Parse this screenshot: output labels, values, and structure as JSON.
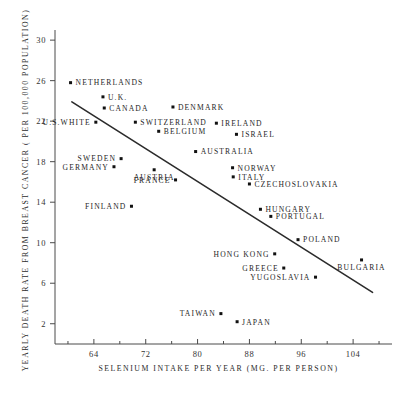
{
  "chart_data": {
    "type": "scatter",
    "title": "",
    "xlabel": "SELENIUM INTAKE PER YEAR (MG. PER PERSON)",
    "ylabel": "YEARLY DEATH RATE FROM BREAST CANCER ( PER 100,000 POPULATION)",
    "xlim": [
      58,
      110
    ],
    "ylim": [
      0,
      31
    ],
    "xticks": [
      64,
      72,
      80,
      88,
      96,
      104
    ],
    "yticks": [
      2,
      6,
      10,
      14,
      18,
      22,
      26,
      30
    ],
    "xtick_labels": [
      "64",
      "72",
      "80",
      "88",
      "96",
      "104"
    ],
    "ytick_labels": [
      "2",
      "6",
      "10",
      "14",
      "18",
      "22",
      "26",
      "30"
    ],
    "grid": false,
    "legend": "none",
    "points": [
      {
        "label": "NETHERLANDS",
        "x": 60.4,
        "y": 25.8,
        "label_side": "right"
      },
      {
        "label": "U.K.",
        "x": 65.4,
        "y": 24.4,
        "label_side": "right"
      },
      {
        "label": "CANADA",
        "x": 65.6,
        "y": 23.3,
        "label_side": "right"
      },
      {
        "label": "DENMARK",
        "x": 76.2,
        "y": 23.4,
        "label_side": "right"
      },
      {
        "label": "SWITZERLAND",
        "x": 70.4,
        "y": 21.9,
        "label_side": "right"
      },
      {
        "label": "IRELAND",
        "x": 82.9,
        "y": 21.8,
        "label_side": "right"
      },
      {
        "label": "U.S.WHITE",
        "x": 64.3,
        "y": 21.9,
        "label_side": "left"
      },
      {
        "label": "BELGIUM",
        "x": 74.0,
        "y": 21.0,
        "label_side": "right"
      },
      {
        "label": "ISRAEL",
        "x": 86.0,
        "y": 20.7,
        "label_side": "right"
      },
      {
        "label": "AUSTRALIA",
        "x": 79.7,
        "y": 19.0,
        "label_side": "right"
      },
      {
        "label": "SWEDEN",
        "x": 68.2,
        "y": 18.3,
        "label_side": "left"
      },
      {
        "label": "GERMANY",
        "x": 67.1,
        "y": 17.5,
        "label_side": "left"
      },
      {
        "label": "AUSTRIA",
        "x": 73.3,
        "y": 17.2,
        "label_side": "below"
      },
      {
        "label": "NORWAY",
        "x": 85.4,
        "y": 17.4,
        "label_side": "right"
      },
      {
        "label": "ITALY",
        "x": 85.5,
        "y": 16.5,
        "label_side": "right"
      },
      {
        "label": "FRANCE",
        "x": 76.6,
        "y": 16.2,
        "label_side": "left"
      },
      {
        "label": "CZECHOSLOVAKIA",
        "x": 88.0,
        "y": 15.8,
        "label_side": "right"
      },
      {
        "label": "FINLAND",
        "x": 69.8,
        "y": 13.6,
        "label_side": "left"
      },
      {
        "label": "HUNGARY",
        "x": 89.7,
        "y": 13.3,
        "label_side": "right"
      },
      {
        "label": "PORTUGAL",
        "x": 91.3,
        "y": 12.6,
        "label_side": "right"
      },
      {
        "label": "POLAND",
        "x": 95.5,
        "y": 10.3,
        "label_side": "right"
      },
      {
        "label": "HONG KONG",
        "x": 91.9,
        "y": 8.9,
        "label_side": "left"
      },
      {
        "label": "BULGARIA",
        "x": 105.3,
        "y": 8.3,
        "label_side": "below"
      },
      {
        "label": "GREECE",
        "x": 93.3,
        "y": 7.5,
        "label_side": "left"
      },
      {
        "label": "YUGOSLAVIA",
        "x": 98.2,
        "y": 6.6,
        "label_side": "left"
      },
      {
        "label": "TAIWAN",
        "x": 83.6,
        "y": 3.0,
        "label_side": "left"
      },
      {
        "label": "JAPAN",
        "x": 86.1,
        "y": 2.2,
        "label_side": "right"
      }
    ],
    "trend_line": {
      "x1": 60.6,
      "y1": 23.9,
      "x2": 107.0,
      "y2": 5.1
    }
  }
}
